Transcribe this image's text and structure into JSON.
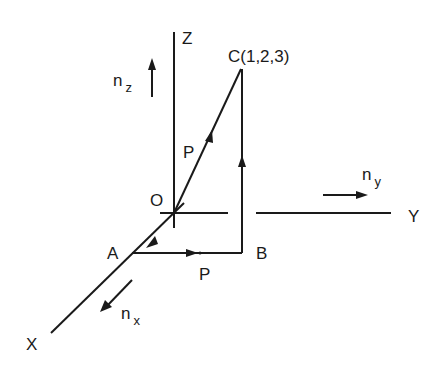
{
  "diagram": {
    "axes": {
      "x_label": "X",
      "y_label": "Y",
      "z_label": "Z",
      "origin_label": "O"
    },
    "unit_vectors": {
      "nx": {
        "base": "n",
        "sub": "x"
      },
      "ny": {
        "base": "n",
        "sub": "y"
      },
      "nz": {
        "base": "n",
        "sub": "z"
      }
    },
    "points": {
      "A": "A",
      "B": "B",
      "C": "C(1,2,3)"
    },
    "path_labels": {
      "diagonal": "P",
      "horizontal": "P"
    },
    "line_color": "#1a1a1a"
  }
}
